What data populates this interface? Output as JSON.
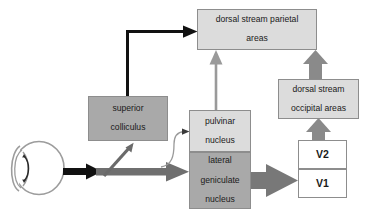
{
  "diagram": {
    "palette": {
      "box_light_fill": "#dcdcdc",
      "box_mid_fill": "#a9a9a9",
      "box_white_fill": "#ffffff",
      "box_stroke": "#8d8d8d",
      "arrow_black": "#111111",
      "arrow_gray_thick": "#7d7d7d",
      "arrow_gray_thin": "#8a8a8a",
      "eye_stroke": "#9a9a9a",
      "background": "#ffffff"
    },
    "nodes": [
      {
        "id": "parietal",
        "label": "dorsal stream parietal areas",
        "line1": "dorsal stream parietal",
        "line2": "areas",
        "fill": "light"
      },
      {
        "id": "colliculus",
        "label": "superior colliculus",
        "line1": "superior",
        "line2": "colliculus",
        "fill": "mid"
      },
      {
        "id": "pulvinar",
        "label": "pulvinar nucleus",
        "line1": "pulvinar",
        "line2": "nucleus",
        "fill": "light"
      },
      {
        "id": "lgn",
        "label": "lateral geniculate nucleus",
        "line1": "lateral",
        "line2": "geniculate",
        "line3": "nucleus",
        "fill": "mid"
      },
      {
        "id": "occipital",
        "label": "dorsal stream occipital areas",
        "line1": "dorsal stream",
        "line2": "occipital areas",
        "fill": "light"
      },
      {
        "id": "v2",
        "label": "V2",
        "fill": "white"
      },
      {
        "id": "v1",
        "label": "V1",
        "fill": "white"
      }
    ],
    "eye": {
      "name": "eye",
      "description": "schematic eye with lens"
    },
    "connections": [
      {
        "id": "eye-to-pathway",
        "from": "eye",
        "to": "pathway",
        "style": "black-block-arrow"
      },
      {
        "id": "pathway-to-colliculus",
        "from": "retina",
        "to": "superior colliculus",
        "style": "gray-line-arrow"
      },
      {
        "id": "pathway-to-pulvinar",
        "from": "retina",
        "to": "pulvinar nucleus",
        "style": "thin-curved-arrow"
      },
      {
        "id": "pathway-to-lgn",
        "from": "retina",
        "to": "lateral geniculate nucleus",
        "style": "gray-block-arrow"
      },
      {
        "id": "colliculus-to-parietal",
        "from": "superior colliculus",
        "to": "dorsal stream parietal areas",
        "style": "black-elbow-arrow"
      },
      {
        "id": "pulvinar-to-parietal",
        "from": "pulvinar nucleus",
        "to": "dorsal stream parietal areas",
        "style": "gray-line-arrow"
      },
      {
        "id": "lgn-to-v1",
        "from": "lateral geniculate nucleus",
        "to": "V1",
        "style": "gray-block-arrow"
      },
      {
        "id": "v2-to-occipital",
        "from": "V2",
        "to": "dorsal stream occipital areas",
        "style": "gray-block-arrow"
      },
      {
        "id": "occipital-to-parietal",
        "from": "dorsal stream occipital areas",
        "to": "dorsal stream parietal areas",
        "style": "gray-block-arrow"
      }
    ]
  }
}
